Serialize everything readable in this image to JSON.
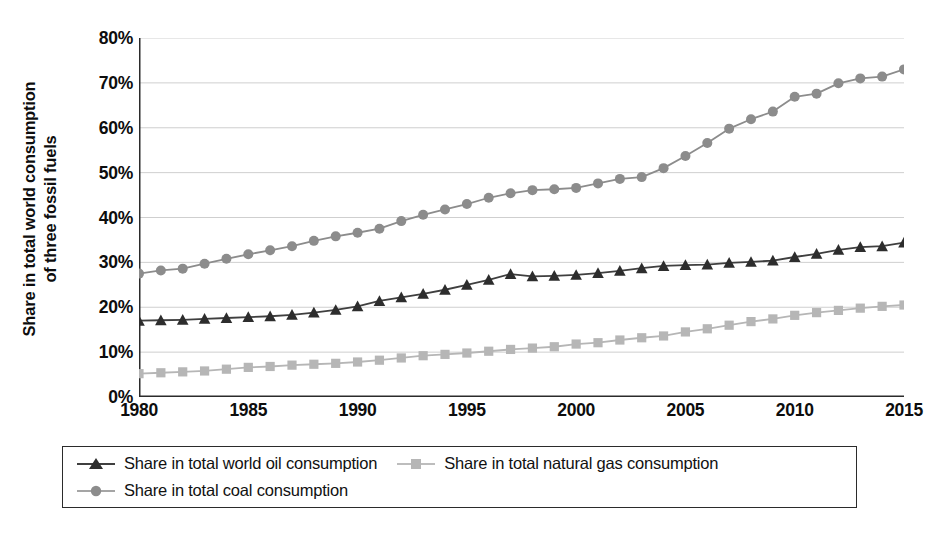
{
  "axis": {
    "y_title_line1": "Share in total world consumption",
    "y_title_line2": "of three fossil fuels",
    "y_ticks": [
      "0%",
      "10%",
      "20%",
      "30%",
      "40%",
      "50%",
      "60%",
      "70%",
      "80%"
    ],
    "x_ticks": [
      "1980",
      "1985",
      "1990",
      "1995",
      "2000",
      "2005",
      "2010",
      "2015"
    ]
  },
  "legend": {
    "items": [
      {
        "label": "Share in total world oil consumption",
        "marker": "triangle-marker",
        "color": "#3f3f3f"
      },
      {
        "label": "Share in total natural gas consumption",
        "marker": "square-marker",
        "color": "#b6b6b6"
      },
      {
        "label": "Share in total coal consumption",
        "marker": "circle-marker",
        "color": "#8c8c8c"
      }
    ]
  },
  "chart_data": {
    "type": "line",
    "title": "",
    "xlabel": "",
    "ylabel": "Share in total world consumption of three fossil fuels",
    "xlim": [
      1980,
      2015
    ],
    "ylim": [
      0,
      80
    ],
    "y_unit": "%",
    "grid": true,
    "legend_position": "bottom",
    "x": [
      1980,
      1981,
      1982,
      1983,
      1984,
      1985,
      1986,
      1987,
      1988,
      1989,
      1990,
      1991,
      1992,
      1993,
      1994,
      1995,
      1996,
      1997,
      1998,
      1999,
      2000,
      2001,
      2002,
      2003,
      2004,
      2005,
      2006,
      2007,
      2008,
      2009,
      2010,
      2011,
      2012,
      2013,
      2014,
      2015
    ],
    "series": [
      {
        "name": "Share in total coal consumption",
        "color": "#8c8c8c",
        "marker": "circle-marker",
        "values": [
          27.5,
          28.2,
          28.6,
          29.7,
          30.8,
          31.8,
          32.7,
          33.6,
          34.8,
          35.8,
          36.6,
          37.5,
          39.2,
          40.6,
          41.8,
          43.0,
          44.4,
          45.4,
          46.1,
          46.3,
          46.6,
          47.6,
          48.6,
          49.0,
          51.0,
          53.7,
          56.6,
          59.8,
          61.9,
          63.6,
          66.9,
          67.6,
          69.9,
          71.0,
          71.4,
          73.0
        ]
      },
      {
        "name": "Share in total world oil consumption",
        "color": "#3f3f3f",
        "marker": "triangle-marker",
        "values": [
          17.0,
          17.1,
          17.2,
          17.4,
          17.6,
          17.8,
          18.0,
          18.3,
          18.8,
          19.4,
          20.2,
          21.4,
          22.2,
          23.0,
          23.9,
          25.0,
          26.1,
          27.4,
          26.9,
          27.0,
          27.2,
          27.6,
          28.1,
          28.7,
          29.2,
          29.4,
          29.5,
          29.9,
          30.1,
          30.4,
          31.2,
          31.9,
          32.8,
          33.4,
          33.6,
          34.4
        ]
      },
      {
        "name": "Share in total natural gas consumption",
        "color": "#b6b6b6",
        "marker": "square-marker",
        "values": [
          5.2,
          5.4,
          5.6,
          5.8,
          6.2,
          6.6,
          6.8,
          7.1,
          7.3,
          7.5,
          7.8,
          8.2,
          8.7,
          9.2,
          9.5,
          9.8,
          10.2,
          10.6,
          10.9,
          11.2,
          11.8,
          12.1,
          12.7,
          13.2,
          13.6,
          14.5,
          15.2,
          16.0,
          16.8,
          17.4,
          18.2,
          18.8,
          19.3,
          19.8,
          20.2,
          20.5
        ]
      }
    ]
  }
}
